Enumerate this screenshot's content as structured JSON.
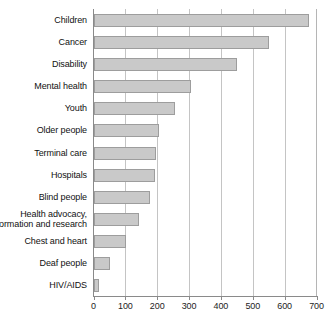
{
  "chart_data": {
    "type": "bar",
    "orientation": "horizontal",
    "title": "",
    "xlabel": "",
    "ylabel": "",
    "xlim": [
      0,
      700
    ],
    "xticks": [
      0,
      100,
      200,
      300,
      400,
      500,
      600,
      700
    ],
    "grid": true,
    "legend": false,
    "bar_color": "#c9c9c9",
    "bar_border_color": "#9d9d9d",
    "axis_color": "#8a8a8a",
    "gridline_color": "#c4c4c4",
    "categories": [
      "Children",
      "Cancer",
      "Disability",
      "Mental health",
      "Youth",
      "Older people",
      "Terminal care",
      "Hospitals",
      "Blind people",
      "Health advocacy, information and research",
      "Chest and heart",
      "Deaf people",
      "HIV/AIDS"
    ],
    "category_labels_display": [
      [
        "Children"
      ],
      [
        "Cancer"
      ],
      [
        "Disability"
      ],
      [
        "Mental health"
      ],
      [
        "Youth"
      ],
      [
        "Older people"
      ],
      [
        "Terminal care"
      ],
      [
        "Hospitals"
      ],
      [
        "Blind people"
      ],
      [
        "Health advocacy,",
        "information and research"
      ],
      [
        "Chest and heart"
      ],
      [
        "Deaf people"
      ],
      [
        "HIV/AIDS"
      ]
    ],
    "values": [
      675,
      550,
      450,
      305,
      255,
      205,
      195,
      190,
      175,
      140,
      100,
      50,
      15
    ]
  }
}
